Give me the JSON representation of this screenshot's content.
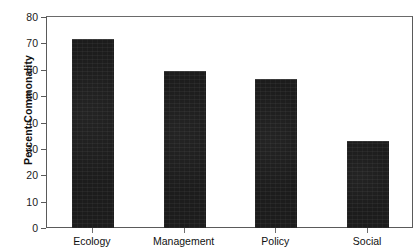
{
  "chart_data": {
    "type": "bar",
    "title": "",
    "subtitle": "",
    "xlabel": "",
    "ylabel": "Percent Commonality",
    "categories": [
      "Ecology",
      "Management",
      "Policy",
      "Social"
    ],
    "values": [
      72,
      60,
      57,
      33.5
    ],
    "series": [
      {
        "name": "Percent Commonality",
        "values": [
          72,
          60,
          57,
          33.5
        ]
      }
    ],
    "ylim": [
      0,
      80
    ],
    "ytick_values": [
      0,
      10,
      20,
      30,
      40,
      50,
      60,
      70,
      80
    ],
    "ytick_labels": [
      "0",
      "10",
      "20",
      "30",
      "40",
      "50",
      "60",
      "70",
      "80"
    ],
    "grid": false,
    "legend": false,
    "legend_position": "none",
    "bar_color": "#1c1c1c",
    "frame_color": "#5a5a5a",
    "background_color": "#ffffff",
    "annotations": []
  },
  "axes": {
    "y_title": "Percent Commonality"
  }
}
